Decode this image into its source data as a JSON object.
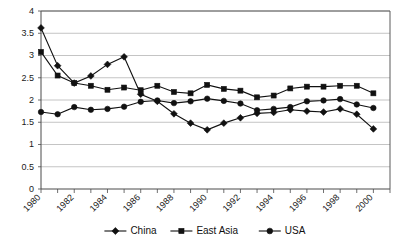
{
  "chart_data": {
    "type": "line",
    "title": "",
    "xlabel": "",
    "ylabel": "",
    "xlim": [
      1980,
      2001
    ],
    "ylim": [
      0,
      4
    ],
    "ytick_values": [
      0,
      0.5,
      1,
      1.5,
      2,
      2.5,
      3,
      3.5,
      4
    ],
    "ytick_labels": [
      "0",
      "0.5",
      "1",
      "1.5",
      "2",
      "2.5",
      "3",
      "3.5",
      "4"
    ],
    "xtick_values": [
      1980,
      1981,
      1982,
      1983,
      1984,
      1985,
      1986,
      1987,
      1988,
      1989,
      1990,
      1991,
      1992,
      1993,
      1994,
      1995,
      1996,
      1997,
      1998,
      1999,
      2000,
      2001
    ],
    "xtick_labels_shown": [
      "1980",
      "1982",
      "1984",
      "1986",
      "1988",
      "1990",
      "1992",
      "1994",
      "1996",
      "1998",
      "2000"
    ],
    "xtick_labels_values": [
      1980,
      1982,
      1984,
      1986,
      1988,
      1990,
      1992,
      1994,
      1996,
      1998,
      2000
    ],
    "grid": true,
    "grid_axis": "y",
    "legend_position": "bottom",
    "x": [
      1980,
      1981,
      1982,
      1983,
      1984,
      1985,
      1986,
      1987,
      1988,
      1989,
      1990,
      1991,
      1992,
      1993,
      1994,
      1995,
      1996,
      1997,
      1998,
      1999,
      2000
    ],
    "series": [
      {
        "name": "China",
        "marker": "diamond",
        "color": "#111111",
        "values": [
          3.62,
          2.77,
          2.38,
          2.54,
          2.8,
          2.97,
          2.13,
          1.97,
          1.69,
          1.48,
          1.33,
          1.48,
          1.6,
          1.7,
          1.72,
          1.78,
          1.75,
          1.73,
          1.8,
          1.68,
          1.35
        ]
      },
      {
        "name": "East Asia",
        "marker": "square",
        "color": "#111111",
        "values": [
          3.08,
          2.55,
          2.38,
          2.32,
          2.23,
          2.28,
          2.22,
          2.32,
          2.18,
          2.15,
          2.34,
          2.25,
          2.21,
          2.06,
          2.1,
          2.26,
          2.3,
          2.3,
          2.32,
          2.32,
          2.15
        ]
      },
      {
        "name": "USA",
        "marker": "circle",
        "color": "#111111",
        "values": [
          1.73,
          1.68,
          1.84,
          1.78,
          1.8,
          1.85,
          1.96,
          1.99,
          1.93,
          1.97,
          2.03,
          1.98,
          1.92,
          1.77,
          1.8,
          1.84,
          1.97,
          1.99,
          2.02,
          1.9,
          1.82
        ]
      }
    ]
  },
  "legend": {
    "items": [
      {
        "label": "China",
        "marker": "diamond"
      },
      {
        "label": "East Asia",
        "marker": "square"
      },
      {
        "label": "USA",
        "marker": "circle"
      }
    ]
  }
}
